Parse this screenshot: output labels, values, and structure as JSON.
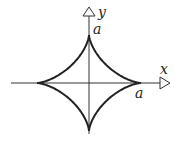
{
  "diagram": {
    "type": "astroid",
    "equation": "x^(2/3) + y^(2/3) = a^(2/3)",
    "axes": {
      "x_label": "x",
      "y_label": "y"
    },
    "labels": {
      "y_intercept": "a",
      "x_intercept": "a"
    },
    "colors": {
      "curve": "#222222",
      "axis": "#333333",
      "background": "#ffffff"
    }
  }
}
